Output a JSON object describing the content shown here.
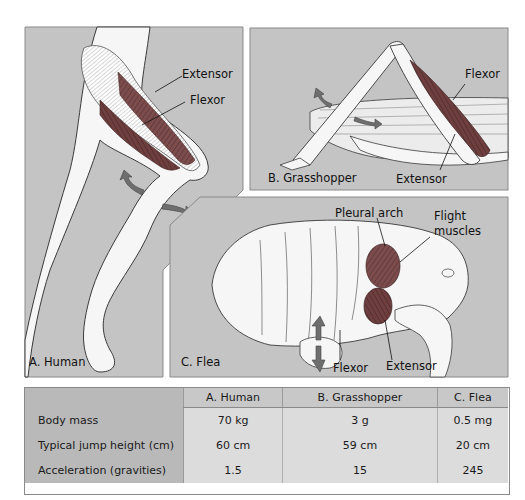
{
  "figure": {
    "panels": [
      {
        "id": "A",
        "label": "A. Human",
        "annotations": [
          "Extensor",
          "Flexor"
        ]
      },
      {
        "id": "B",
        "label": "B. Grasshopper",
        "annotations": [
          "Flexor",
          "Extensor"
        ]
      },
      {
        "id": "C",
        "label": "C. Flea",
        "annotations": [
          "Pleural arch",
          "Flight",
          "muscles",
          "Flexor",
          "Extensor"
        ]
      }
    ],
    "colors": {
      "panel_bg": "#c4c4c4",
      "muscle": "#7a4a4a",
      "arrow": "#6e6e6e",
      "outline": "#3a3a3a",
      "body_fill": "#f6f6f6"
    }
  },
  "table": {
    "headers": [
      "",
      "A. Human",
      "B. Grasshopper",
      "C. Flea"
    ],
    "rows": [
      {
        "label": "Body mass",
        "values": [
          "70 kg",
          "3 g",
          "0.5 mg"
        ]
      },
      {
        "label": "Typical jump height (cm)",
        "values": [
          "60 cm",
          "59 cm",
          "20 cm"
        ]
      },
      {
        "label": "Acceleration (gravities)",
        "values": [
          "1.5",
          "15",
          "245"
        ]
      }
    ]
  }
}
